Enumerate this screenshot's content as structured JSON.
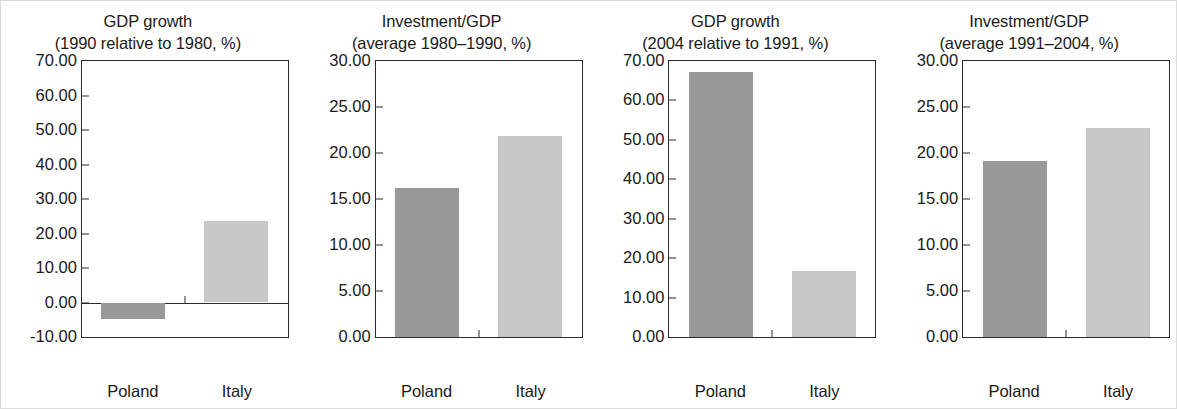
{
  "figure": {
    "background": "#ffffff",
    "border_color": "#dcdcdc",
    "axis_color": "#2b2b2b",
    "text_color": "#1a1a1a"
  },
  "series_colors": {
    "Poland": "#989898",
    "Italy": "#c8c8c8"
  },
  "chart_data": [
    {
      "type": "bar",
      "title": "GDP growth",
      "subtitle": "(1990 relative to 1980, %)",
      "categories": [
        "Poland",
        "Italy"
      ],
      "values": [
        -4.8,
        23.6
      ],
      "colors": [
        "#989898",
        "#c8c8c8"
      ],
      "xlabel": "",
      "ylabel": "",
      "ylim": [
        -10,
        70
      ],
      "ytick_step": 10,
      "ytick_labels": [
        "70.00",
        "60.00",
        "50.00",
        "40.00",
        "30.00",
        "20.00",
        "10.00",
        "0.00",
        "-10.00"
      ],
      "ytick_values": [
        70,
        60,
        50,
        40,
        30,
        20,
        10,
        0,
        -10
      ],
      "grid": false,
      "legend": "none"
    },
    {
      "type": "bar",
      "title": "Investment/GDP",
      "subtitle": "(average 1980–1990, %)",
      "categories": [
        "Poland",
        "Italy"
      ],
      "values": [
        16.2,
        21.9
      ],
      "colors": [
        "#989898",
        "#c8c8c8"
      ],
      "xlabel": "",
      "ylabel": "",
      "ylim": [
        0,
        30
      ],
      "ytick_step": 5,
      "ytick_labels": [
        "30.00",
        "25.00",
        "20.00",
        "15.00",
        "10.00",
        "5.00",
        "0.00"
      ],
      "ytick_values": [
        30,
        25,
        20,
        15,
        10,
        5,
        0
      ],
      "grid": false,
      "legend": "none"
    },
    {
      "type": "bar",
      "title": "GDP growth",
      "subtitle": "(2004 relative to 1991, %)",
      "categories": [
        "Poland",
        "Italy"
      ],
      "values": [
        67.3,
        16.8
      ],
      "colors": [
        "#989898",
        "#c8c8c8"
      ],
      "xlabel": "",
      "ylabel": "",
      "ylim": [
        0,
        70
      ],
      "ytick_step": 10,
      "ytick_labels": [
        "70.00",
        "60.00",
        "50.00",
        "40.00",
        "30.00",
        "20.00",
        "10.00",
        "0.00"
      ],
      "ytick_values": [
        70,
        60,
        50,
        40,
        30,
        20,
        10,
        0
      ],
      "grid": false,
      "legend": "none"
    },
    {
      "type": "bar",
      "title": "Investment/GDP",
      "subtitle": "(average 1991–2004, %)",
      "categories": [
        "Poland",
        "Italy"
      ],
      "values": [
        19.1,
        22.7
      ],
      "colors": [
        "#989898",
        "#c8c8c8"
      ],
      "xlabel": "",
      "ylabel": "",
      "ylim": [
        0,
        30
      ],
      "ytick_step": 5,
      "ytick_labels": [
        "30.00",
        "25.00",
        "20.00",
        "15.00",
        "10.00",
        "5.00",
        "0.00"
      ],
      "ytick_values": [
        30,
        25,
        20,
        15,
        10,
        5,
        0
      ],
      "grid": false,
      "legend": "none"
    }
  ]
}
